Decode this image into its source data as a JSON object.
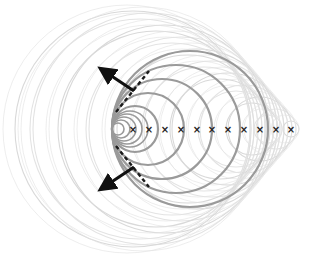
{
  "diagram": {
    "colors": {
      "background": "#ffffff",
      "faint_wave": "#d9d9d9",
      "faint_wave_inner": "#e3e3e3",
      "bold_wave": "#9a9a9a",
      "source_marker": "#222222",
      "arrow": "#111111",
      "dashed_front": "#1a1a1a"
    },
    "source_axis_y": 129,
    "source_markers": [
      {
        "x": 133,
        "label": "×"
      },
      {
        "x": 149,
        "label": "×"
      },
      {
        "x": 165,
        "label": "×"
      },
      {
        "x": 181,
        "label": "×"
      },
      {
        "x": 197,
        "label": "×"
      },
      {
        "x": 212,
        "label": "×"
      },
      {
        "x": 228,
        "label": "×"
      },
      {
        "x": 244,
        "label": "×"
      },
      {
        "x": 260,
        "label": "×"
      },
      {
        "x": 276,
        "label": "×"
      },
      {
        "x": 291,
        "label": "×"
      }
    ],
    "bold_wavefronts": [
      {
        "cx": 135,
        "cy": 129,
        "r": 23
      },
      {
        "cx": 148,
        "cy": 129,
        "r": 36
      },
      {
        "cx": 162,
        "cy": 129,
        "r": 50
      },
      {
        "cx": 176,
        "cy": 129,
        "r": 64
      },
      {
        "cx": 190,
        "cy": 129,
        "r": 78
      }
    ],
    "faint_wavefronts": [
      {
        "cx": 291,
        "r": 8
      },
      {
        "cx": 276,
        "r": 20
      },
      {
        "cx": 260,
        "r": 32
      },
      {
        "cx": 244,
        "r": 44
      },
      {
        "cx": 228,
        "r": 56
      },
      {
        "cx": 212,
        "r": 68
      },
      {
        "cx": 197,
        "r": 80
      },
      {
        "cx": 181,
        "r": 92
      },
      {
        "cx": 165,
        "r": 104
      },
      {
        "cx": 149,
        "r": 116
      },
      {
        "cx": 133,
        "r": 118
      },
      {
        "cx": 140,
        "r": 110
      },
      {
        "cx": 156,
        "r": 98
      },
      {
        "cx": 172,
        "r": 86
      },
      {
        "cx": 188,
        "r": 74
      },
      {
        "cx": 204,
        "r": 62
      },
      {
        "cx": 220,
        "r": 50
      },
      {
        "cx": 236,
        "r": 38
      },
      {
        "cx": 252,
        "r": 26
      },
      {
        "cx": 268,
        "r": 14
      }
    ],
    "dashed_fronts": [
      {
        "name": "upper-shock-front",
        "x1": 116,
        "y1": 112,
        "x2": 149,
        "y2": 71
      },
      {
        "name": "lower-shock-front",
        "x1": 116,
        "y1": 146,
        "x2": 149,
        "y2": 187
      }
    ],
    "arrows": [
      {
        "name": "upper-normal-arrow",
        "x1": 134,
        "y1": 91,
        "x2": 104,
        "y2": 71
      },
      {
        "name": "lower-normal-arrow",
        "x1": 134,
        "y1": 167,
        "x2": 104,
        "y2": 187
      }
    ]
  }
}
